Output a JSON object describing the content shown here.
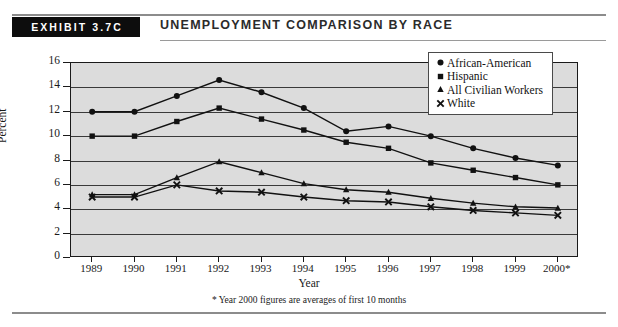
{
  "exhibit": {
    "tag": "EXHIBIT 3.7C",
    "title": "UNEMPLOYMENT COMPARISON BY RACE"
  },
  "chart_data": {
    "type": "line",
    "title": "Unemployment Comparison by Race",
    "xlabel": "Year",
    "ylabel": "Percent",
    "ylim": [
      0,
      16
    ],
    "ytick_step": 2,
    "yticks": [
      "0",
      "2",
      "4",
      "6",
      "8",
      "10",
      "12",
      "14",
      "16"
    ],
    "grid": true,
    "legend_position": "top-right",
    "footnote": "* Year 2000 figures are averages of first 10 months",
    "categories": [
      "1989",
      "1990",
      "1991",
      "1992",
      "1993",
      "1994",
      "1995",
      "1996",
      "1997",
      "1998",
      "1999",
      "2000*"
    ],
    "series": [
      {
        "name": "African-American",
        "marker": "circle",
        "color": "#111111",
        "values": [
          12.0,
          12.0,
          13.3,
          14.6,
          13.6,
          12.3,
          10.4,
          10.8,
          10.0,
          9.0,
          8.2,
          7.6
        ]
      },
      {
        "name": "Hispanic",
        "marker": "square",
        "color": "#111111",
        "values": [
          10.0,
          10.0,
          11.2,
          12.3,
          11.4,
          10.5,
          9.5,
          9.0,
          7.8,
          7.2,
          6.6,
          6.0
        ]
      },
      {
        "name": "All Civilian Workers",
        "marker": "triangle",
        "color": "#111111",
        "values": [
          5.2,
          5.2,
          6.6,
          7.9,
          7.0,
          6.1,
          5.6,
          5.4,
          4.9,
          4.5,
          4.2,
          4.1
        ]
      },
      {
        "name": "White",
        "marker": "cross",
        "color": "#111111",
        "values": [
          5.0,
          5.0,
          6.0,
          5.5,
          5.4,
          5.0,
          4.7,
          4.6,
          4.2,
          3.9,
          3.7,
          3.5
        ]
      }
    ]
  }
}
